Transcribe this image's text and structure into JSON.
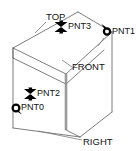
{
  "diagram": {
    "background_color": "#ffffff",
    "line_color": "#6e6e6e",
    "marker_color": "#000000",
    "text_color": "#111111",
    "face_labels": [
      {
        "id": "top",
        "text": "TOP",
        "x": 54,
        "y": 17
      },
      {
        "id": "front",
        "text": "FRONT",
        "x": 75,
        "y": 67
      },
      {
        "id": "right",
        "text": "RIGHT",
        "x": 86,
        "y": 142
      }
    ],
    "points": [
      {
        "id": "pnt3",
        "text": "PNT3",
        "marker": "x-marker",
        "marker_x": 61,
        "marker_y": 27,
        "label_x": 68,
        "label_y": 27
      },
      {
        "id": "pnt1",
        "text": "PNT1",
        "marker": "circle-marker",
        "marker_x": 107,
        "marker_y": 32,
        "label_x": 113,
        "label_y": 32
      },
      {
        "id": "pnt2",
        "text": "PNT2",
        "marker": "x-marker",
        "marker_x": 30,
        "marker_y": 94,
        "label_x": 37,
        "label_y": 94
      },
      {
        "id": "pnt0",
        "text": "PNT0",
        "marker": "circle-marker",
        "marker_x": 16,
        "marker_y": 108,
        "label_x": 22,
        "label_y": 108
      }
    ]
  }
}
